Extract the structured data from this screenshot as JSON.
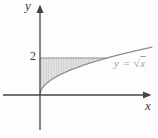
{
  "figure": {
    "y_axis_label": "y",
    "x_axis_label": "x",
    "y_tick_label": "2",
    "curve_label_prefix": "y = ",
    "curve_label_sqrt": "√",
    "curve_label_radicand": "x"
  },
  "colors": {
    "axis": "#454545",
    "curve": "#8f8f8f",
    "boundary_line": "#909090",
    "shade_fill": "#e3e3e3",
    "shade_stripe": "#cdcdcd",
    "curve_label_text": "#9a9a9a",
    "label_text": "#3a3a3a"
  },
  "chart_data": {
    "type": "line",
    "function": "y = sqrt(x)",
    "curve_label": "y = √x",
    "x_axis_label": "x",
    "y_axis_label": "y",
    "y_ticks": [
      2
    ],
    "x_range_shown": [
      0,
      6.7
    ],
    "y_range_shown": [
      0,
      2.6
    ],
    "grid": false,
    "horizontal_boundary_line_y": 2,
    "curve_intersection_with_line": {
      "x": 4,
      "y": 2
    },
    "shaded_region": "Region bounded by the y-axis (x = 0), the horizontal line y = 2, and the curve y = √x, for 0 ≤ x ≤ 4",
    "shading_style": "light gray with fine vertical hatching",
    "curve_samples": [
      {
        "x": 0,
        "y": 0
      },
      {
        "x": 1,
        "y": 1
      },
      {
        "x": 2,
        "y": 1.41
      },
      {
        "x": 3,
        "y": 1.73
      },
      {
        "x": 4,
        "y": 2
      },
      {
        "x": 5,
        "y": 2.24
      },
      {
        "x": 6,
        "y": 2.45
      },
      {
        "x": 6.7,
        "y": 2.59
      }
    ]
  }
}
